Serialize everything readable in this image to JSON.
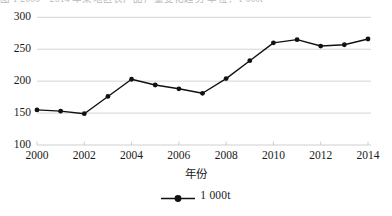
{
  "top_caption": "图 1  2000—2014 年某地区农产品产量变化趋势  单位：1 000t",
  "chart_data": {
    "type": "line",
    "title": "",
    "subtitle": "",
    "xlabel": "年份",
    "ylabel": "",
    "legend_position": "bottom-center",
    "grid": true,
    "xlim": [
      2000,
      2014
    ],
    "ylim": [
      100,
      300
    ],
    "ytick_labels": [
      "100",
      "150",
      "200",
      "250",
      "300"
    ],
    "ytick_values": [
      100,
      150,
      200,
      250,
      300
    ],
    "xtick_labels": [
      "2000",
      "2002",
      "2004",
      "2006",
      "2008",
      "2010",
      "2012",
      "2014"
    ],
    "xtick_values": [
      2000,
      2002,
      2004,
      2006,
      2008,
      2010,
      2012,
      2014
    ],
    "x": [
      2000,
      2001,
      2002,
      2003,
      2004,
      2005,
      2006,
      2007,
      2008,
      2009,
      2010,
      2011,
      2012,
      2013,
      2014
    ],
    "series": [
      {
        "name": "1 000t",
        "marker": "filled-circle",
        "color": "#111111",
        "values": [
          155,
          153,
          149,
          176,
          203,
          194,
          188,
          181,
          204,
          232,
          260,
          265,
          255,
          257,
          266
        ]
      }
    ],
    "legend_entries": [
      "1 000t"
    ]
  },
  "style": {
    "grid_color": "#c9c9c9",
    "line_color": "#111111",
    "marker_color": "#111111",
    "text_color": "#1a1a1a",
    "background": "#ffffff"
  }
}
